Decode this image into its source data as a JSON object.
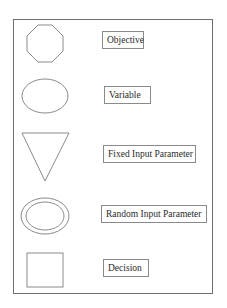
{
  "legend": {
    "items": [
      {
        "shape": "octagon",
        "label": "Objective"
      },
      {
        "shape": "ellipse",
        "label": "Variable"
      },
      {
        "shape": "inverted-triangle",
        "label": "Fixed Input Parameter"
      },
      {
        "shape": "double-ellipse",
        "label": "Random Input Parameter"
      },
      {
        "shape": "square",
        "label": "Decision"
      }
    ]
  },
  "colors": {
    "stroke": "#7a7a7a",
    "frame": "#6e6e6e",
    "text": "#2a2a2a"
  }
}
